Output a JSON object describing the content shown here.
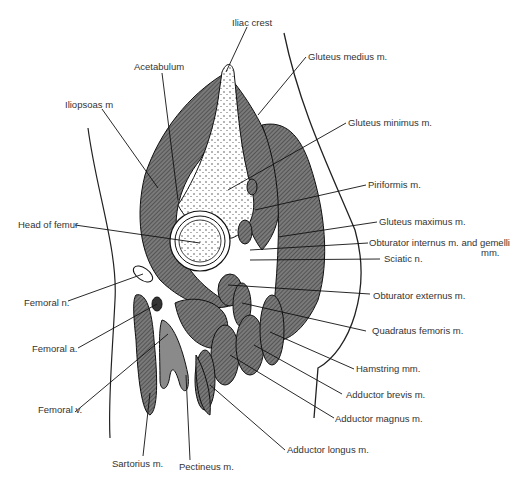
{
  "diagram": {
    "type": "anatomical cross-section",
    "colors": {
      "muscle": "#6e6e6e",
      "outline": "#1a1a1a",
      "bone": "#ffffff",
      "vessel": "#8a8a8a"
    },
    "labels": {
      "iliac_crest": "Iliac crest",
      "acetabulum": "Acetabulum",
      "iliopsoas": "Iliopsoas m",
      "gluteus_medius": "Gluteus medius m.",
      "gluteus_minimus": "Gluteus minimus m.",
      "piriformis": "Piriformis m.",
      "gluteus_maximus": "Gluteus maximus m.",
      "obturator_internus": "Obturator internus m. and gemelli",
      "obturator_internus_2": "mm.",
      "sciatic": "Sciatic n.",
      "head_of_femur": "Head of femur",
      "femoral_n": "Femoral n.",
      "obturator_externus": "Obturator externus m.",
      "quadratus_femoris": "Quadratus femoris m.",
      "femoral_a": "Femoral a.",
      "hamstring": "Hamstring mm.",
      "adductor_brevis": "Adductor brevis m.",
      "femoral_v": "Femoral v.",
      "adductor_magnus": "Adductor magnus m.",
      "adductor_longus": "Adductor longus m.",
      "sartorius": "Sartorius m.",
      "pectineus": "Pectineus m."
    }
  }
}
